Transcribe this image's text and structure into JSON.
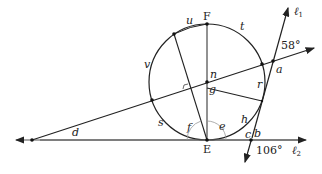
{
  "diagram": {
    "labels": {
      "F": "F",
      "E": "E",
      "u": "u",
      "t": "t",
      "v": "v",
      "n": "n",
      "g": "g",
      "a": "a",
      "r": "r",
      "s": "s",
      "h": "h",
      "f": "f",
      "e": "e",
      "c": "c",
      "b": "b",
      "d": "d",
      "l1": "ℓ",
      "l1_sub": "1",
      "l2": "ℓ",
      "l2_sub": "2",
      "angle_58": "58°",
      "angle_106": "106°"
    },
    "colors": {
      "stroke": "#222222",
      "diameter": "#777777",
      "arc": "#999999"
    }
  }
}
